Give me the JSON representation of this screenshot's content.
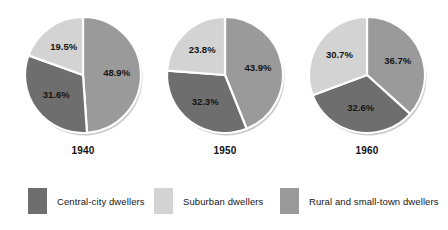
{
  "chart_data": {
    "type": "pie",
    "title": "",
    "subtitle": "",
    "xlabel": "",
    "ylabel": "",
    "legend_position": "bottom",
    "grid": false,
    "units": "percent",
    "categories": [
      "Rural and small-town dwellers",
      "Central-city dwellers",
      "Suburban dwellers"
    ],
    "category_colors": [
      "#9a9a9a",
      "#6e6e6e",
      "#d3d3d3"
    ],
    "separator_color": "#ffffff",
    "charts": [
      {
        "title": "1940",
        "slices": [
          {
            "label": "Rural and small-town dwellers",
            "value": 48.9,
            "display": "48.9%",
            "color": "#9a9a9a"
          },
          {
            "label": "Central-city dwellers",
            "value": 31.6,
            "display": "31.6%",
            "color": "#6e6e6e"
          },
          {
            "label": "Suburban dwellers",
            "value": 19.5,
            "display": "19.5%",
            "color": "#d3d3d3"
          }
        ]
      },
      {
        "title": "1950",
        "slices": [
          {
            "label": "Rural and small-town dwellers",
            "value": 43.9,
            "display": "43.9%",
            "color": "#9a9a9a"
          },
          {
            "label": "Central-city dwellers",
            "value": 32.3,
            "display": "32.3%",
            "color": "#6e6e6e"
          },
          {
            "label": "Suburban dwellers",
            "value": 23.8,
            "display": "23.8%",
            "color": "#d3d3d3"
          }
        ]
      },
      {
        "title": "1960",
        "slices": [
          {
            "label": "Rural and small-town dwellers",
            "value": 36.7,
            "display": "36.7%",
            "color": "#9a9a9a"
          },
          {
            "label": "Central-city dwellers",
            "value": 32.6,
            "display": "32.6%",
            "color": "#6e6e6e"
          },
          {
            "label": "Suburban dwellers",
            "value": 30.7,
            "display": "30.7%",
            "color": "#d3d3d3"
          }
        ]
      }
    ],
    "legend": [
      {
        "label": "Central-city dwellers",
        "color": "#6e6e6e"
      },
      {
        "label": "Suburban dwellers",
        "color": "#d3d3d3"
      },
      {
        "label": "Rural and small-town dwellers",
        "color": "#9a9a9a"
      }
    ]
  }
}
